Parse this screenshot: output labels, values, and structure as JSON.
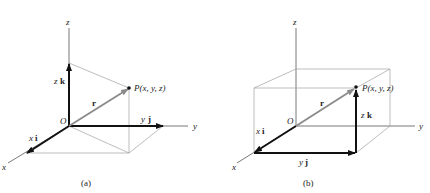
{
  "figure": {
    "panels": [
      {
        "id": "a",
        "caption": "(a)",
        "labels": {
          "z_axis": "z",
          "y_axis": "y",
          "x_axis": "x",
          "origin": "O",
          "point": "P(x, y, z)",
          "r": "r",
          "zk_scalar": "z",
          "zk_vector": "k",
          "yj_scalar": "y",
          "yj_vector": "j",
          "xi_scalar": "x",
          "xi_vector": "i"
        }
      },
      {
        "id": "b",
        "caption": "(b)",
        "labels": {
          "z_axis": "z",
          "y_axis": "y",
          "x_axis": "x",
          "origin": "O",
          "point": "P(x, y, z)",
          "r": "r",
          "zk_scalar": "z",
          "zk_vector": "k",
          "yj_scalar": "y",
          "yj_vector": "j",
          "xi_scalar": "x",
          "xi_vector": "i"
        }
      }
    ],
    "colors": {
      "axis": "#555555",
      "construction": "#9a9a9a",
      "vector_component": "#111111",
      "vector_r": "#8a8a8a"
    }
  }
}
